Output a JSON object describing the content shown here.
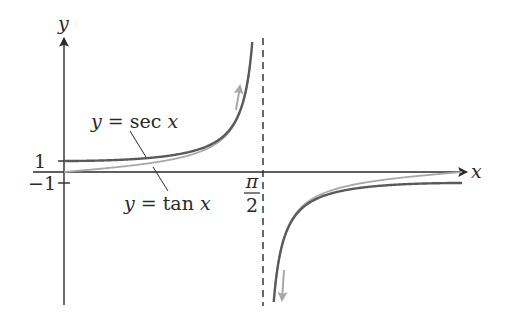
{
  "chart_data": {
    "type": "line",
    "title": "",
    "xlabel": "x",
    "ylabel": "y",
    "xlim": [
      0,
      3.1416
    ],
    "x_ticks": [
      {
        "value": 1.5708,
        "label_num": "π",
        "label_den": "2"
      }
    ],
    "y_ticks": [
      {
        "value": 1,
        "label": "1"
      },
      {
        "value": -1,
        "label": "−1"
      }
    ],
    "asymptote": {
      "x": 1.5708,
      "style": "dashed"
    },
    "grid": false,
    "legend": "inline annotations",
    "series": [
      {
        "name": "y = sec x",
        "function": "sec",
        "color": "#5a5a5a",
        "width": 2.4,
        "sample_points": [
          [
            0,
            1
          ],
          [
            0.5,
            1.14
          ],
          [
            1.0,
            1.85
          ],
          [
            1.3,
            3.74
          ],
          [
            1.45,
            8.4
          ],
          [
            1.69,
            -8.4
          ],
          [
            2.0,
            -2.4
          ],
          [
            2.5,
            -1.25
          ],
          [
            3.14,
            -1
          ]
        ]
      },
      {
        "name": "y = tan x",
        "function": "tan",
        "color": "#a8a8a8",
        "width": 1.8,
        "sample_points": [
          [
            0,
            0
          ],
          [
            0.5,
            0.55
          ],
          [
            1.0,
            1.56
          ],
          [
            1.3,
            3.6
          ],
          [
            1.45,
            8.2
          ],
          [
            1.69,
            -8.2
          ],
          [
            2.0,
            -2.19
          ],
          [
            2.5,
            -0.75
          ],
          [
            3.14,
            0
          ]
        ]
      }
    ],
    "annotations": [
      {
        "text_prefix": "y",
        "text_eq": " = sec ",
        "text_var": "x",
        "points_to": "sec"
      },
      {
        "text_prefix": "y",
        "text_eq": " = tan ",
        "text_var": "x",
        "points_to": "tan"
      }
    ],
    "direction_arrows": [
      {
        "near": "left branch top",
        "direction": "up",
        "color": "#a8a8a8"
      },
      {
        "near": "right branch bottom",
        "direction": "down",
        "color": "#a8a8a8"
      }
    ]
  }
}
